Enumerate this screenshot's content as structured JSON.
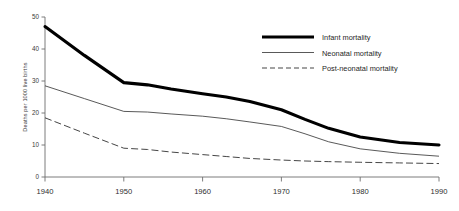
{
  "chart_data": {
    "type": "line",
    "title": "",
    "subtitle": "",
    "xlabel": "",
    "ylabel": "Deaths per 1000 live births",
    "x": [
      1940,
      1950,
      1960,
      1970,
      1980,
      1990
    ],
    "xlim": [
      1940,
      1990
    ],
    "ylim": [
      0,
      50
    ],
    "xticks": [
      1940,
      1950,
      1960,
      1970,
      1980,
      1990
    ],
    "xtick_labels": [
      "1940",
      "1950",
      "1960",
      "1970",
      "1980",
      "1990"
    ],
    "yticks": [
      0,
      10,
      20,
      30,
      40,
      50
    ],
    "ytick_labels": [
      "0",
      "10",
      "20",
      "30",
      "40",
      "50"
    ],
    "grid": false,
    "legend_position": "top-right",
    "series": [
      {
        "name": "Infant mortality",
        "style": "thick-solid",
        "color": "#000000",
        "values": [
          47.0,
          29.5,
          26.0,
          21.0,
          12.5,
          10.0
        ],
        "points": [
          {
            "x": 1940,
            "y": 47.0
          },
          {
            "x": 1945,
            "y": 38.0
          },
          {
            "x": 1950,
            "y": 29.5
          },
          {
            "x": 1953,
            "y": 28.8
          },
          {
            "x": 1956,
            "y": 27.5
          },
          {
            "x": 1960,
            "y": 26.0
          },
          {
            "x": 1963,
            "y": 25.0
          },
          {
            "x": 1966,
            "y": 23.6
          },
          {
            "x": 1970,
            "y": 21.0
          },
          {
            "x": 1973,
            "y": 18.0
          },
          {
            "x": 1976,
            "y": 15.2
          },
          {
            "x": 1980,
            "y": 12.5
          },
          {
            "x": 1985,
            "y": 10.8
          },
          {
            "x": 1990,
            "y": 10.0
          }
        ]
      },
      {
        "name": "Neonatal mortality",
        "style": "thin-solid",
        "color": "#3b3b3b",
        "values": [
          28.5,
          20.5,
          19.0,
          15.8,
          8.8,
          6.5
        ],
        "points": [
          {
            "x": 1940,
            "y": 28.5
          },
          {
            "x": 1945,
            "y": 24.5
          },
          {
            "x": 1950,
            "y": 20.5
          },
          {
            "x": 1953,
            "y": 20.3
          },
          {
            "x": 1956,
            "y": 19.7
          },
          {
            "x": 1960,
            "y": 19.0
          },
          {
            "x": 1963,
            "y": 18.2
          },
          {
            "x": 1966,
            "y": 17.2
          },
          {
            "x": 1970,
            "y": 15.8
          },
          {
            "x": 1973,
            "y": 13.5
          },
          {
            "x": 1976,
            "y": 11.0
          },
          {
            "x": 1980,
            "y": 8.8
          },
          {
            "x": 1985,
            "y": 7.4
          },
          {
            "x": 1990,
            "y": 6.5
          }
        ]
      },
      {
        "name": "Post-neonatal mortality",
        "style": "dashed",
        "color": "#3b3b3b",
        "values": [
          18.5,
          9.0,
          7.0,
          5.3,
          4.6,
          4.2
        ],
        "points": [
          {
            "x": 1940,
            "y": 18.5
          },
          {
            "x": 1945,
            "y": 13.7
          },
          {
            "x": 1950,
            "y": 9.0
          },
          {
            "x": 1953,
            "y": 8.6
          },
          {
            "x": 1956,
            "y": 7.8
          },
          {
            "x": 1960,
            "y": 7.0
          },
          {
            "x": 1963,
            "y": 6.4
          },
          {
            "x": 1966,
            "y": 5.8
          },
          {
            "x": 1970,
            "y": 5.3
          },
          {
            "x": 1973,
            "y": 5.0
          },
          {
            "x": 1976,
            "y": 4.8
          },
          {
            "x": 1980,
            "y": 4.6
          },
          {
            "x": 1985,
            "y": 4.4
          },
          {
            "x": 1990,
            "y": 4.2
          }
        ]
      }
    ]
  },
  "legend": {
    "entries": [
      {
        "label": "Infant mortality"
      },
      {
        "label": "Neonatal mortality"
      },
      {
        "label": "Post-neonatal mortality"
      }
    ]
  }
}
